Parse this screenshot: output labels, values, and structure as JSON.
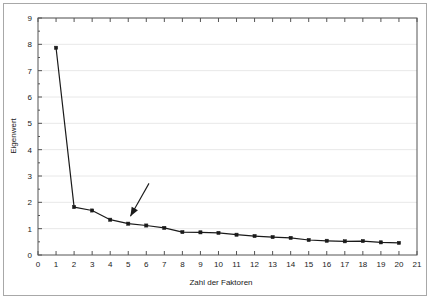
{
  "chart_data": {
    "type": "line",
    "title": "",
    "subtitle": "",
    "xlabel": "Zahl der Faktoren",
    "ylabel": "Eigenwert",
    "xlim": [
      0,
      21
    ],
    "ylim": [
      0,
      9
    ],
    "xticks": [
      "0",
      "1",
      "2",
      "3",
      "4",
      "5",
      "6",
      "7",
      "8",
      "9",
      "10",
      "11",
      "12",
      "13",
      "14",
      "15",
      "16",
      "17",
      "18",
      "19",
      "20",
      "21"
    ],
    "yticks": [
      "0",
      "1",
      "2",
      "3",
      "4",
      "5",
      "6",
      "7",
      "8",
      "9"
    ],
    "grid": "horizontal",
    "legend": "none",
    "marker": "square",
    "line_color": "#1a1a1a",
    "marker_color": "#1a1a1a",
    "grid_color": "#e8e8e8",
    "axis_color": "#555555",
    "x": [
      1,
      2,
      3,
      4,
      5,
      6,
      7,
      8,
      9,
      10,
      11,
      12,
      13,
      14,
      15,
      16,
      17,
      18,
      19,
      20
    ],
    "values": [
      7.87,
      1.82,
      1.69,
      1.34,
      1.19,
      1.12,
      1.03,
      0.87,
      0.86,
      0.84,
      0.77,
      0.72,
      0.68,
      0.65,
      0.57,
      0.54,
      0.52,
      0.53,
      0.48,
      0.46
    ],
    "series": [
      {
        "name": "Eigenwert",
        "values": [
          7.87,
          1.82,
          1.69,
          1.34,
          1.19,
          1.12,
          1.03,
          0.87,
          0.86,
          0.84,
          0.77,
          0.72,
          0.68,
          0.65,
          0.57,
          0.54,
          0.52,
          0.53,
          0.48,
          0.46
        ]
      }
    ],
    "annotations": [
      {
        "type": "arrow",
        "name": "elbow-arrow",
        "label": "",
        "tail_x": 6.15,
        "tail_y": 2.72,
        "head_x": 5.12,
        "head_y": 1.47
      }
    ]
  }
}
